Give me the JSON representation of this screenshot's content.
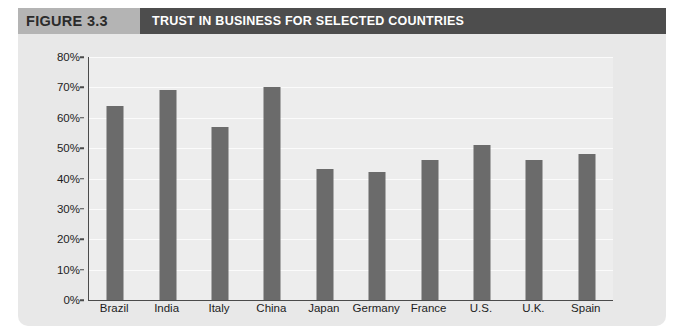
{
  "figure": {
    "number_label": "FIGURE 3.3",
    "title": "TRUST IN BUSINESS FOR SELECTED COUNTRIES",
    "number_band_color": "#b4b4b4",
    "title_band_color": "#4d4d4d",
    "card_background": "#e8e8e8"
  },
  "chart_data": {
    "type": "bar",
    "title": "TRUST IN BUSINESS FOR SELECTED COUNTRIES",
    "xlabel": "",
    "ylabel": "",
    "categories": [
      "Brazil",
      "India",
      "Italy",
      "China",
      "Japan",
      "Germany",
      "France",
      "U.S.",
      "U.K.",
      "Spain"
    ],
    "values": [
      64,
      69,
      57,
      70,
      43,
      42,
      46,
      51,
      46,
      48
    ],
    "value_suffix": "%",
    "ylim": [
      0,
      80
    ],
    "ytick_values": [
      0,
      10,
      20,
      30,
      40,
      50,
      60,
      70,
      80
    ],
    "ytick_labels": [
      "0%",
      "10%",
      "20%",
      "30%",
      "40%",
      "50%",
      "60%",
      "70%",
      "80%"
    ],
    "grid": true,
    "legend": false,
    "bar_color": "#6b6b6b",
    "plot_background": "#ededed",
    "axis_color": "#4a4a4a",
    "gridline_color": "#fbfbfb"
  }
}
